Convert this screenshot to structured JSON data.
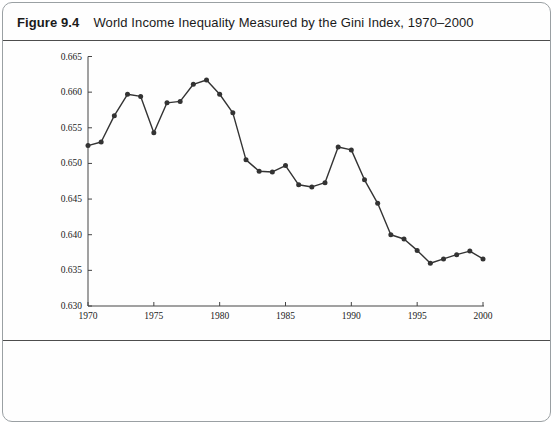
{
  "figure": {
    "label": "Figure 9.4",
    "title": "World Income Inequality Measured by the Gini Index, 1970–2000"
  },
  "chart_data": {
    "type": "line",
    "title": "World Income Inequality Measured by the Gini Index, 1970–2000",
    "series_name": "World Gini index",
    "x": [
      1970,
      1971,
      1972,
      1973,
      1974,
      1975,
      1976,
      1977,
      1978,
      1979,
      1980,
      1981,
      1982,
      1983,
      1984,
      1985,
      1986,
      1987,
      1988,
      1989,
      1990,
      1991,
      1992,
      1993,
      1994,
      1995,
      1996,
      1997,
      1998,
      1999,
      2000
    ],
    "values": [
      0.6525,
      0.653,
      0.6567,
      0.6597,
      0.6594,
      0.6543,
      0.6585,
      0.6587,
      0.6611,
      0.6617,
      0.6597,
      0.6571,
      0.6505,
      0.6489,
      0.6488,
      0.6497,
      0.647,
      0.6467,
      0.6473,
      0.6523,
      0.6519,
      0.6477,
      0.6444,
      0.64,
      0.6394,
      0.6378,
      0.636,
      0.6366,
      0.6372,
      0.6377,
      0.6366
    ],
    "xlabel": "",
    "ylabel": "",
    "xlim": [
      1970,
      2000
    ],
    "ylim": [
      0.63,
      0.665
    ],
    "x_ticks": [
      1970,
      1975,
      1980,
      1985,
      1990,
      1995,
      2000
    ],
    "y_ticks": [
      0.63,
      0.635,
      0.64,
      0.645,
      0.65,
      0.655,
      0.66,
      0.665
    ],
    "y_tick_decimals": 3,
    "grid": false,
    "legend": "none",
    "marker": "circle",
    "line_color": "#333333",
    "axis_color": "#444444"
  }
}
